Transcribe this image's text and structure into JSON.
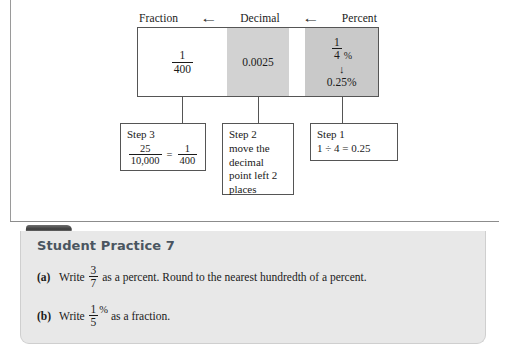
{
  "diagram": {
    "header": [
      {
        "label": "Fraction",
        "name": "header-fraction"
      },
      {
        "arrow": "←",
        "name": "arrow-left-1"
      },
      {
        "label": "Decimal",
        "name": "header-decimal"
      },
      {
        "arrow": "←",
        "name": "arrow-left-2"
      },
      {
        "label": "Percent",
        "name": "header-percent"
      }
    ],
    "fraction_cell": {
      "numerator": "1",
      "denominator": "400"
    },
    "decimal_cell": {
      "value": "0.0025"
    },
    "percent_cell": {
      "top_numerator": "1",
      "top_denominator": "4",
      "percent_sign": "%",
      "arrow_down": "↓",
      "bottom_value": "0.25%"
    }
  },
  "steps": {
    "step3": {
      "label": "Step 3",
      "left_numerator": "25",
      "left_denominator": "10,000",
      "equals": "=",
      "right_numerator": "1",
      "right_denominator": "400"
    },
    "step2": {
      "label": "Step 2",
      "body": "move the decimal point left 2 places"
    },
    "step1": {
      "label": "Step 1",
      "equation": "1 ÷ 4 = 0.25"
    }
  },
  "practice": {
    "title": "Student Practice 7",
    "items": [
      {
        "marker": "(a)",
        "prefix": "Write",
        "numerator": "3",
        "denominator": "7",
        "percent_sign": "",
        "suffix": "as a percent. Round to the nearest hundredth of a percent."
      },
      {
        "marker": "(b)",
        "prefix": "Write",
        "numerator": "1",
        "denominator": "5",
        "percent_sign": "%",
        "suffix": "as a fraction."
      }
    ]
  },
  "colors": {
    "panel_bg": "#e8e8e8",
    "cell_gray": "#d2d2d2",
    "cell_gray_dark": "#c9c9c9",
    "title_color": "#4a5560",
    "rule_color": "#8c8c8c"
  }
}
